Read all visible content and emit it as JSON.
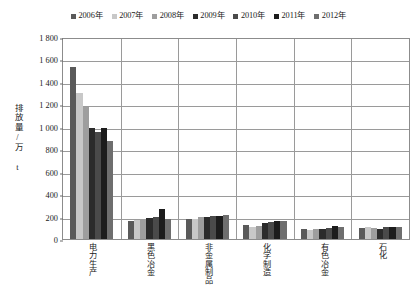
{
  "chart_data": {
    "type": "bar",
    "title": "",
    "xlabel": "",
    "ylabel": "排放量/万 t",
    "ylim": [
      0,
      1800
    ],
    "ytick_step": 200,
    "yticks": [
      "1 800",
      "1 600",
      "1 400",
      "1 200",
      "1 000",
      "800",
      "600",
      "400",
      "200",
      "0"
    ],
    "grid": true,
    "legend_position": "top",
    "categories": [
      "电力生产",
      "黑色冶金",
      "非金属制品",
      "化学制造",
      "有色冶金",
      "石化"
    ],
    "series": [
      {
        "name": "2006年",
        "color": "#5a5a5a",
        "values": [
          1530,
          160,
          175,
          125,
          85,
          100
        ]
      },
      {
        "name": "2007年",
        "color": "#c8c8c8",
        "values": [
          1300,
          170,
          180,
          110,
          80,
          105
        ]
      },
      {
        "name": "2008年",
        "color": "#9e9e9e",
        "values": [
          1180,
          175,
          195,
          120,
          85,
          95
        ]
      },
      {
        "name": "2009年",
        "color": "#2b2b2b",
        "values": [
          990,
          190,
          200,
          140,
          90,
          90
        ]
      },
      {
        "name": "2010年",
        "color": "#4a4a4a",
        "values": [
          950,
          195,
          205,
          150,
          95,
          105
        ]
      },
      {
        "name": "2011年",
        "color": "#1c1c1c",
        "values": [
          985,
          265,
          205,
          160,
          115,
          110
        ]
      },
      {
        "name": "2012年",
        "color": "#6e6e6e",
        "values": [
          870,
          175,
          210,
          160,
          110,
          105
        ]
      }
    ]
  },
  "legend": {
    "items": [
      {
        "label": "2006年"
      },
      {
        "label": "2007年"
      },
      {
        "label": "2008年"
      },
      {
        "label": "2009年"
      },
      {
        "label": "2010年"
      },
      {
        "label": "2011年"
      },
      {
        "label": "2012年"
      }
    ]
  },
  "axis": {
    "y_title": "排放量/万 t"
  }
}
